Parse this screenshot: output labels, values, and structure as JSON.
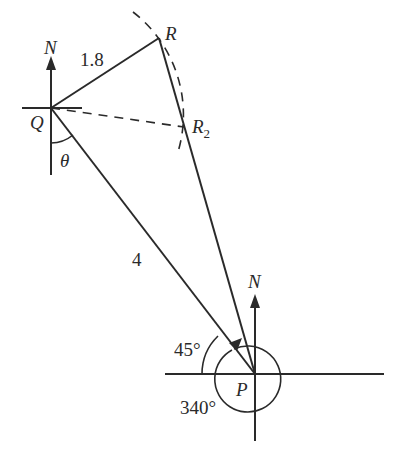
{
  "diagram": {
    "type": "bearing-geometry",
    "points": {
      "Q": {
        "label": "Q",
        "x": 51,
        "y": 108
      },
      "R": {
        "label": "R",
        "x": 159,
        "y": 38
      },
      "R2": {
        "label": "R",
        "sub": "2",
        "x": 184,
        "y": 127
      },
      "P": {
        "label": "P",
        "x": 255,
        "y": 374
      }
    },
    "segments": [
      {
        "from": "Q",
        "to": "R",
        "label": "1.8",
        "style": "solid"
      },
      {
        "from": "Q",
        "to": "P",
        "label": "4",
        "style": "solid"
      },
      {
        "from": "R",
        "to": "P",
        "label": "",
        "style": "solid"
      },
      {
        "from": "Q",
        "to": "R2",
        "label": "",
        "style": "dashed"
      }
    ],
    "north_labels": {
      "Q": "N",
      "P": "N"
    },
    "angles": {
      "theta": "θ",
      "p45": "45°",
      "p340": "340°"
    },
    "colors": {
      "stroke": "#2a2a2a",
      "background": "#ffffff"
    }
  }
}
